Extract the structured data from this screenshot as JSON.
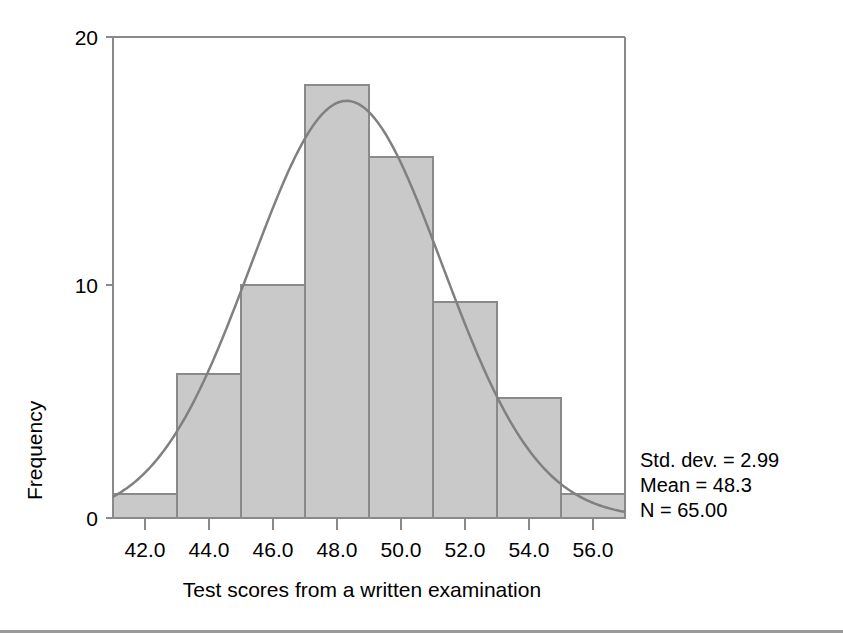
{
  "chart_data": {
    "type": "bar",
    "subtype": "histogram-with-normal-curve",
    "title": "",
    "xlabel": "Test scores from a written examination",
    "ylabel": "Frequency",
    "categories": [
      "42.0",
      "44.0",
      "46.0",
      "48.0",
      "50.0",
      "52.0",
      "54.0",
      "56.0"
    ],
    "bin_centers": [
      42,
      44,
      46,
      48,
      50,
      52,
      54,
      56
    ],
    "bin_width": 2,
    "values": [
      1,
      6,
      10,
      18,
      15,
      9,
      5,
      1
    ],
    "x": [
      42,
      44,
      46,
      48,
      50,
      52,
      54,
      56
    ],
    "xlim": [
      41,
      57
    ],
    "ylim": [
      0,
      20
    ],
    "xticks": [
      "42.0",
      "44.0",
      "46.0",
      "48.0",
      "50.0",
      "52.0",
      "54.0",
      "56.0"
    ],
    "yticks": [
      "0",
      "10",
      "20"
    ],
    "ytick_values": [
      0,
      10,
      20
    ],
    "grid": false,
    "legend": false,
    "legend_position": "none",
    "overlay_curve": {
      "name": "normal distribution curve",
      "mean": 48.3,
      "std_dev": 2.99,
      "n": 65,
      "scale_bin_width": 2
    },
    "annotations": {
      "std_dev": "Std. dev. = 2.99",
      "mean": "Mean = 48.3",
      "n": "N = 65.00"
    },
    "colors": {
      "bar_fill": "#c9c9c9",
      "bar_stroke": "#8a8a8a",
      "curve": "#808080",
      "axis": "#8a8a8a",
      "text": "#000000",
      "background": "#ffffff"
    }
  },
  "axes": {
    "y_title": "Frequency",
    "x_title": "Test scores from a written examination",
    "y_tick_labels": [
      "20",
      "10",
      "0"
    ],
    "x_tick_labels": [
      "42.0",
      "44.0",
      "46.0",
      "48.0",
      "50.0",
      "52.0",
      "54.0",
      "56.0"
    ]
  },
  "stats_box": {
    "line1": "Std. dev. = 2.99",
    "line2": "Mean = 48.3",
    "line3": "N = 65.00"
  }
}
